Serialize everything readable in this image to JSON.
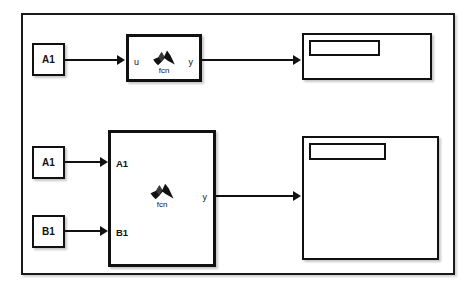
{
  "diagram": {
    "background_color": "#ffffff",
    "line_color": "#111111"
  },
  "rows": [
    {
      "id": "single-input-row",
      "source_blocks": [
        {
          "name": "const-a1-top",
          "label": "A1"
        }
      ],
      "function_block": {
        "name": "matlab-function-block-top",
        "icon": "matlab-membrane-icon",
        "caption": "fcn",
        "inputs": [
          {
            "label": "u"
          }
        ],
        "outputs": [
          {
            "label": "y"
          }
        ]
      },
      "display_block": {
        "name": "display-block-top",
        "readout_value": ""
      }
    },
    {
      "id": "two-input-row",
      "source_blocks": [
        {
          "name": "const-a1-bottom",
          "label": "A1"
        },
        {
          "name": "const-b1-bottom",
          "label": "B1"
        }
      ],
      "function_block": {
        "name": "matlab-function-block-bottom",
        "icon": "matlab-membrane-icon",
        "caption": "fcn",
        "inputs": [
          {
            "label": "A1"
          },
          {
            "label": "B1"
          }
        ],
        "outputs": [
          {
            "label": "y"
          }
        ]
      },
      "display_block": {
        "name": "display-block-bottom",
        "readout_value": ""
      }
    }
  ]
}
